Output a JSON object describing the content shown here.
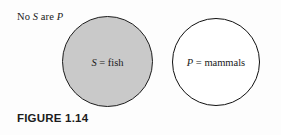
{
  "figure": {
    "caption": "FIGURE 1.14",
    "proposition": {
      "prefix": "No ",
      "subject_var": "S",
      "middle": " are ",
      "predicate_var": "P"
    },
    "background_color": "#fdfdfd"
  },
  "diagram": {
    "type": "venn-two-circle-disjoint",
    "circles": [
      {
        "id": "subject",
        "variable": "S",
        "term": "fish",
        "label": "S = fish",
        "fill_color": "#c9c9c9",
        "stroke_color": "#1d1d1d",
        "shaded": "true"
      },
      {
        "id": "predicate",
        "variable": "P",
        "term": "mammals",
        "label": "P = mammals",
        "fill_color": "#ffffff",
        "stroke_color": "#101010",
        "shaded": "false"
      }
    ]
  }
}
